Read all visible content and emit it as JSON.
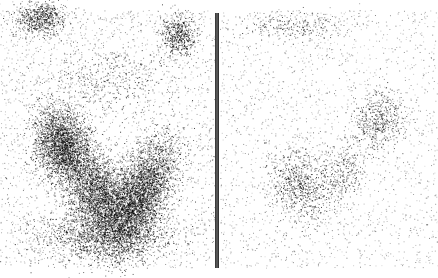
{
  "image": {
    "description": "Two-panel grayscale scintigraphy-style image: dense dot clouds on white background, separated by a vertical double line",
    "background": "#ffffff",
    "dot_color": "#000000",
    "divider_color": "#222222"
  },
  "panels": [
    {
      "id": "left",
      "x": 0,
      "width": 215,
      "height": 278,
      "background_density": 0.045,
      "clusters": [
        {
          "cx": 40,
          "cy": 18,
          "rx": 22,
          "ry": 14,
          "angle": 0,
          "count": 700
        },
        {
          "cx": 178,
          "cy": 35,
          "rx": 14,
          "ry": 18,
          "angle": 0,
          "count": 550
        },
        {
          "cx": 105,
          "cy": 80,
          "rx": 60,
          "ry": 25,
          "angle": 0,
          "count": 400
        },
        {
          "cx": 62,
          "cy": 145,
          "rx": 22,
          "ry": 32,
          "angle": -0.3,
          "count": 2600
        },
        {
          "cx": 98,
          "cy": 195,
          "rx": 25,
          "ry": 40,
          "angle": -0.35,
          "count": 2800
        },
        {
          "cx": 140,
          "cy": 195,
          "rx": 22,
          "ry": 50,
          "angle": 0.45,
          "count": 3600
        },
        {
          "cx": 105,
          "cy": 235,
          "rx": 60,
          "ry": 22,
          "angle": 0,
          "count": 1500
        }
      ]
    },
    {
      "id": "right",
      "x": 220,
      "width": 218,
      "height": 278,
      "background_density": 0.035,
      "clusters": [
        {
          "cx": 70,
          "cy": 25,
          "rx": 45,
          "ry": 12,
          "angle": 0,
          "count": 250
        },
        {
          "cx": 160,
          "cy": 120,
          "rx": 20,
          "ry": 25,
          "angle": 0.3,
          "count": 500
        },
        {
          "cx": 78,
          "cy": 185,
          "rx": 22,
          "ry": 30,
          "angle": -0.3,
          "count": 650
        },
        {
          "cx": 120,
          "cy": 175,
          "rx": 20,
          "ry": 30,
          "angle": 0.4,
          "count": 350
        }
      ]
    }
  ]
}
